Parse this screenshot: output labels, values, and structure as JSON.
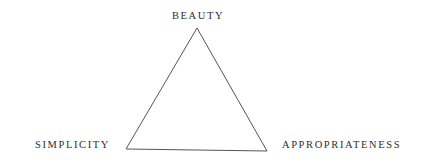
{
  "diagram": {
    "type": "triangle",
    "vertices": {
      "top": {
        "label": "BEAUTY",
        "x": 197,
        "y": 28
      },
      "bottom_left": {
        "label": "SIMPLICITY",
        "x": 126,
        "y": 149
      },
      "bottom_right": {
        "label": "APPROPRIATENESS",
        "x": 267,
        "y": 151
      }
    },
    "stroke_color": "#555555",
    "text_color": "#2e2e2e"
  }
}
